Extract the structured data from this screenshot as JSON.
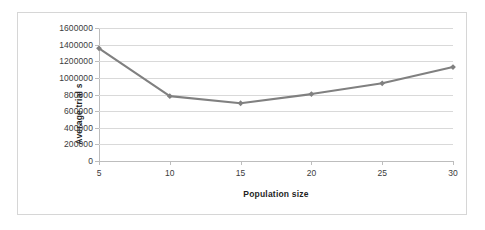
{
  "chart_data": {
    "type": "line",
    "title": "",
    "xlabel": "Population size",
    "ylabel": "Average trial s",
    "x": [
      5,
      10,
      15,
      20,
      25,
      30
    ],
    "xticklabels": [
      "5",
      "10",
      "15",
      "20",
      "25",
      "30"
    ],
    "xlim": [
      5,
      30
    ],
    "values": [
      1355000,
      780000,
      695000,
      805000,
      935000,
      1130000
    ],
    "series": [
      {
        "name": "Average trial s",
        "values": [
          1355000,
          780000,
          695000,
          805000,
          935000,
          1130000
        ]
      }
    ],
    "yticks": [
      0,
      200000,
      400000,
      600000,
      800000,
      1000000,
      1200000,
      1400000,
      1600000
    ],
    "yticklabels": [
      "0",
      "200000",
      "400000",
      "600000",
      "800000",
      "1000000",
      "1200000",
      "1400000",
      "1600000"
    ],
    "ylim": [
      0,
      1600000
    ],
    "grid": "horizontal",
    "legend": "none",
    "line_color": "#808080",
    "marker": "diamond",
    "marker_color": "#808080",
    "gridline_color": "#d9d9d9",
    "axis_color": "#bdbdbd",
    "plot_background": "#ffffff",
    "border_color": "#d6d6d6"
  }
}
